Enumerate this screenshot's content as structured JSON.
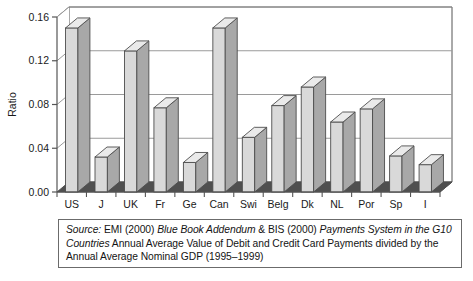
{
  "chart_data": {
    "type": "bar",
    "title": "",
    "xlabel": "",
    "ylabel": "Ratio",
    "categories": [
      "US",
      "J",
      "UK",
      "Fr",
      "Ge",
      "Can",
      "Swi",
      "Belg",
      "Dk",
      "NL",
      "Por",
      "Sp",
      "I"
    ],
    "values": [
      0.15,
      0.032,
      0.129,
      0.077,
      0.027,
      0.15,
      0.05,
      0.079,
      0.096,
      0.064,
      0.076,
      0.033,
      0.025
    ],
    "ylim": [
      0.0,
      0.16
    ],
    "ytick_labels": [
      "0.00",
      "0.04",
      "0.08",
      "0.12",
      "0.16"
    ],
    "ytick_values": [
      0.0,
      0.04,
      0.08,
      0.12,
      0.16
    ],
    "grid": true,
    "legend": "none",
    "style": "3d-column",
    "colors": {
      "bar_front": "#d9d9d9",
      "bar_side": "#a8a8a8",
      "bar_top": "#eaeaea",
      "bar_outline": "#4d4d4d",
      "floor": "#4f4f4f",
      "grid": "#9a9a9a",
      "axis": "#555555",
      "background": "#ffffff"
    }
  },
  "caption": {
    "source_label": "Source:",
    "seg_emi": " EMI (2000) ",
    "seg_bluebook": "Blue Book Addendum",
    "seg_bis": " & BIS (2000) ",
    "seg_payments": "Payments System in the G10 Countries",
    "seg_tail": " Annual Average Value of Debit and Credit Card Payments divided by the Annual Average Nominal GDP (1995–1999)"
  }
}
